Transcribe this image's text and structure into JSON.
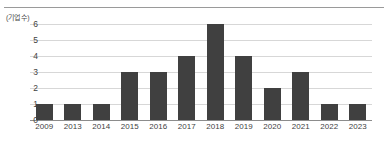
{
  "chart_data": {
    "type": "bar",
    "title": "",
    "subtitle": "",
    "xlabel": "",
    "ylabel": "(기업 수)",
    "unit_label": "(기업 수)",
    "categories": [
      "2009",
      "2013",
      "2014",
      "2015",
      "2016",
      "2017",
      "2018",
      "2019",
      "2020",
      "2021",
      "2022",
      "2023"
    ],
    "values": [
      1,
      1,
      1,
      3,
      3,
      4,
      6,
      4,
      2,
      3,
      1,
      1
    ],
    "series": [
      {
        "name": "기업 수",
        "values": [
          1,
          1,
          1,
          3,
          3,
          4,
          6,
          4,
          2,
          3,
          1,
          1
        ]
      }
    ],
    "ylim": [
      0,
      6
    ],
    "yticks": [
      "0",
      "1",
      "2",
      "3",
      "4",
      "5",
      "6"
    ],
    "ytick_values": [
      0,
      1,
      2,
      3,
      4,
      5,
      6
    ],
    "grid": true,
    "legend": false,
    "legend_position": "none",
    "colors": {
      "bar": "#404040",
      "gridline": "#d7d7d7",
      "axis": "#8c8c8c",
      "text": "#3f3f3f",
      "background": "#ffffff",
      "top_rule": "#9a9a9a"
    }
  }
}
